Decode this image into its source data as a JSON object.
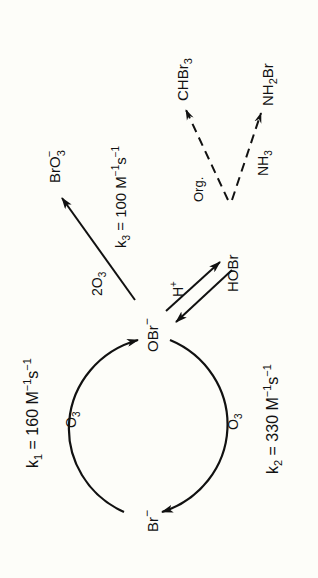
{
  "diagram": {
    "type": "reaction-scheme",
    "orientation": "rotated-90-ccw",
    "species": {
      "bromide": "Br",
      "bromide_charge": "−",
      "hypobromite": "OBr",
      "hypobromite_charge": "−",
      "bromate": "BrO",
      "bromate_sub": "3",
      "bromate_charge": "−",
      "hypobromous_acid": "HOBr",
      "bromoform": "CHBr",
      "bromoform_sub": "3",
      "bromamine_a": "NH",
      "bromamine_sub": "2",
      "bromamine_b": "Br"
    },
    "reagents": {
      "ozone_1": "O",
      "ozone_1_sub": "3",
      "ozone_2": "O",
      "ozone_2_sub": "3",
      "ozone_3_coef": "2O",
      "ozone_3_sub": "3",
      "proton": "H",
      "proton_sup": "+",
      "organics": "Org.",
      "ammonia": "NH",
      "ammonia_sub": "3"
    },
    "rate_constants": {
      "k1": {
        "k": "k",
        "idx": "1",
        "text": " = 160 M",
        "exp1": "−1",
        "s": "s",
        "exp2": "−1"
      },
      "k2": {
        "k": "k",
        "idx": "2",
        "text": " = 330 M",
        "exp1": "−1",
        "s": "s",
        "exp2": "−1"
      },
      "k3": {
        "k": "k",
        "idx": "3",
        "text": " = 100 M",
        "exp1": "−1",
        "s": "s",
        "exp2": "−1"
      }
    },
    "edges": [
      {
        "from": "Br−",
        "to": "OBr−",
        "reagent": "O3",
        "rate": "k1",
        "style": "solid-arc"
      },
      {
        "from": "OBr−",
        "to": "Br−",
        "reagent": "O3",
        "rate": "k2",
        "style": "solid-arc"
      },
      {
        "from": "OBr−",
        "to": "BrO3−",
        "reagent": "2O3",
        "rate": "k3",
        "style": "solid"
      },
      {
        "from": "OBr−",
        "to": "HOBr",
        "reagent": "H+",
        "style": "equilibrium"
      },
      {
        "from": "HOBr",
        "to": "CHBr3",
        "reagent": "Org.",
        "style": "dashed"
      },
      {
        "from": "HOBr",
        "to": "NH2Br",
        "reagent": "NH3",
        "style": "dashed"
      }
    ]
  }
}
